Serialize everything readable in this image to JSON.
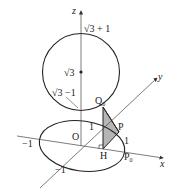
{
  "diagram": {
    "axes": {
      "x_label": "x",
      "y_label": "y",
      "z_label": "z",
      "origin_label": "O"
    },
    "labels": {
      "z_top": "√3 + 1",
      "z_center": "√3",
      "z_bottom": "√3 −1",
      "x_pos_one": "1",
      "x_neg_one": "−1",
      "y_pos_one": "1",
      "y_neg_one": "−1",
      "Q0": "Q",
      "Q0_sub": "0",
      "P": "P",
      "H": "H",
      "P0": "P",
      "P0_sub": "0"
    },
    "colors": {
      "stroke": "#222222",
      "triangle_fill": "#b5b5b5",
      "axis_stroke": "#444444"
    }
  }
}
